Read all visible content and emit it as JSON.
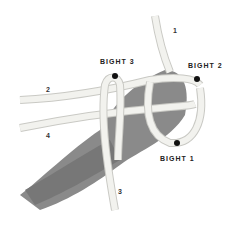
{
  "image": {
    "description": "Photograph of a hand wrapped in white rope forming a knot, with labeled bights and rope strand numbers",
    "labels": {
      "bight_1": "BIGHT 1",
      "bight_2": "BIGHT 2",
      "bight_3": "BIGHT 3"
    },
    "strand_numbers": {
      "s1": "1",
      "s2": "2",
      "s3": "3",
      "s4": "4"
    },
    "colors": {
      "background": "#ffffff",
      "rope": "#f2f2ee",
      "rope_shadow": "#c9c9c4",
      "skin": "#8a8a8a",
      "label": "#222222",
      "marker": "#111111"
    }
  }
}
